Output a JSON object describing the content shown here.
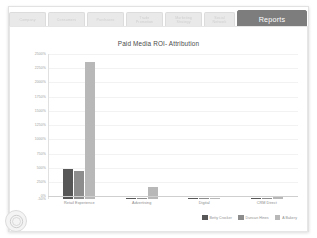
{
  "window": {
    "active_tab": "Reports"
  },
  "tabs": [
    {
      "label": "Company",
      "active": false,
      "width_class": "w1"
    },
    {
      "label": "Consumers",
      "active": false,
      "width_class": "w2"
    },
    {
      "label": "Purchases",
      "active": false,
      "width_class": "w3"
    },
    {
      "label": "Trade\nPromotion",
      "active": false,
      "width_class": "w4"
    },
    {
      "label": "Marketing\nStrategy",
      "active": false,
      "width_class": "w5"
    },
    {
      "label": "Social\nNetwork",
      "active": false,
      "width_class": "w6"
    },
    {
      "label": "Reports",
      "active": true,
      "width_class": "active"
    }
  ],
  "chart_data": {
    "type": "bar",
    "title": "Paid Media ROI- Attribution",
    "xlabel": "",
    "ylabel": "",
    "ylim": [
      -50,
      2500
    ],
    "ytick_step": 250,
    "grid": true,
    "legend_position": "bottom-right",
    "ytick_labels": [
      "2500%",
      "2250%",
      "2000%",
      "1750%",
      "1500%",
      "1250%",
      "1000%",
      "750%",
      "500%",
      "250%",
      "0%",
      "-50%"
    ],
    "ytick_values": [
      2500,
      2250,
      2000,
      1750,
      1500,
      1250,
      1000,
      750,
      500,
      250,
      0,
      -50
    ],
    "categories": [
      "Retail Experience",
      "Advertising",
      "Digital",
      "CRM Direct"
    ],
    "series": [
      {
        "name": "Betty Crocker",
        "color": "#575757",
        "values": [
          530,
          10,
          8,
          6
        ]
      },
      {
        "name": "Duncan Hines",
        "color": "#8d8d8d",
        "values": [
          495,
          12,
          7,
          9
        ]
      },
      {
        "name": "A Bakery",
        "color": "#b8b8b8",
        "values": [
          2405,
          205,
          6,
          35
        ]
      }
    ]
  },
  "legend": {
    "items": [
      {
        "label": "Betty Crocker",
        "color": "#575757"
      },
      {
        "label": "Duncan Hines",
        "color": "#8d8d8d"
      },
      {
        "label": "A Bakery",
        "color": "#b8b8b8"
      }
    ]
  },
  "brand_badge": {
    "name": "company-logo"
  }
}
